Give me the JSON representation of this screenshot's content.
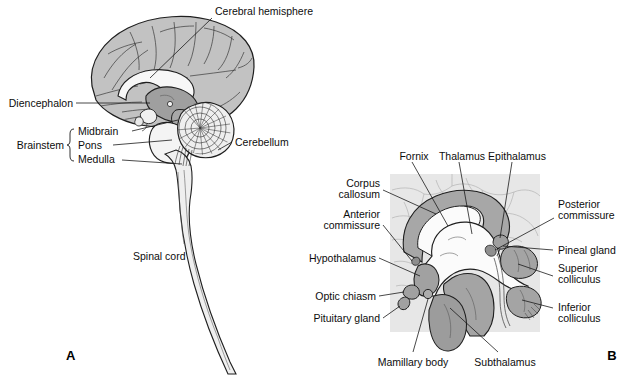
{
  "figure": {
    "panels": [
      {
        "letter": "A",
        "name": "midsagittal-brain-overview",
        "labels": [
          "Cerebral hemisphere",
          "Diencephalon",
          "Brainstem",
          "Midbrain",
          "Pons",
          "Medulla",
          "Cerebellum",
          "Spinal cord"
        ]
      },
      {
        "letter": "B",
        "name": "diencephalon-detail",
        "labels": [
          "Fornix",
          "Thalamus",
          "Epithalamus",
          "Corpus callosum",
          "Anterior commissure",
          "Hypothalamus",
          "Optic chiasm",
          "Pituitary gland",
          "Posterior commissure",
          "Pineal gland",
          "Superior colliculus",
          "Inferior colliculus",
          "Mamillary body",
          "Subthalamus"
        ]
      }
    ]
  },
  "panelA": {
    "letter": "A",
    "cerebral_hemisphere": "Cerebral hemisphere",
    "diencephalon": "Diencephalon",
    "brainstem": "Brainstem",
    "midbrain": "Midbrain",
    "pons": "Pons",
    "medulla": "Medulla",
    "cerebellum": "Cerebellum",
    "spinal_cord": "Spinal cord"
  },
  "panelB": {
    "letter": "B",
    "fornix": "Fornix",
    "thalamus": "Thalamus",
    "epithalamus": "Epithalamus",
    "corpus_callosum_1": "Corpus",
    "corpus_callosum_2": "callosum",
    "anterior_commissure_1": "Anterior",
    "anterior_commissure_2": "commissure",
    "hypothalamus": "Hypothalamus",
    "optic_chiasm": "Optic chiasm",
    "pituitary_gland": "Pituitary gland",
    "posterior_commissure_1": "Posterior",
    "posterior_commissure_2": "commissure",
    "pineal_gland": "Pineal gland",
    "superior_colliculus_1": "Superior",
    "superior_colliculus_2": "colliculus",
    "inferior_colliculus_1": "Inferior",
    "inferior_colliculus_2": "colliculus",
    "mamillary_body": "Mamillary body",
    "subthalamus": "Subthalamus"
  },
  "colors": {
    "background": "#ffffff",
    "panel_b_box": "#e7e7e7",
    "cortex_grey": "#c2c2c2",
    "mid_grey": "#a9a9a9",
    "dark_grey": "#9a9a9a",
    "pale": "#f2f2f2",
    "white_structure": "#fbfbfb",
    "outline": "#1f1f1f",
    "text": "#0d0d0d"
  }
}
